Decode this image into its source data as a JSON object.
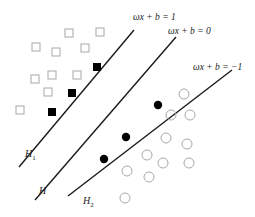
{
  "diagram": {
    "colors": {
      "line": "#1a1a1a",
      "hollow_marker": "#a8a8a8",
      "support_vector": "#000000",
      "text": "#222222"
    },
    "hyperplanes": [
      {
        "id": "H1",
        "label": "H",
        "subscript": "1",
        "equation": "ωx + b = 1",
        "x1": 19,
        "y1": 167,
        "x2": 134,
        "y2": 30,
        "label_pos": [
          25,
          157
        ],
        "eq_pos": [
          133,
          20
        ]
      },
      {
        "id": "H",
        "label": "H",
        "subscript": "",
        "equation": "ωx + b = 0",
        "x1": 35,
        "y1": 200,
        "x2": 176,
        "y2": 37,
        "label_pos": [
          39,
          194
        ],
        "eq_pos": [
          168,
          34
        ]
      },
      {
        "id": "H2",
        "label": "H",
        "subscript": "2",
        "equation": "ωx + b = −1",
        "x1": 68,
        "y1": 196,
        "x2": 232,
        "y2": 70,
        "label_pos": [
          83,
          204
        ],
        "eq_pos": [
          193,
          70
        ]
      }
    ],
    "class_positive": {
      "shape": "square",
      "hollow_points": [
        [
          69,
          33
        ],
        [
          100,
          32
        ],
        [
          36,
          47
        ],
        [
          56,
          52
        ],
        [
          85,
          48
        ],
        [
          52,
          75
        ],
        [
          77,
          75
        ],
        [
          35,
          79
        ],
        [
          48,
          92
        ],
        [
          20,
          110
        ]
      ],
      "support_vectors": [
        [
          97,
          67
        ],
        [
          72,
          93
        ],
        [
          52,
          112
        ]
      ]
    },
    "class_negative": {
      "shape": "circle",
      "hollow_points": [
        [
          184,
          94
        ],
        [
          171,
          115
        ],
        [
          190,
          115
        ],
        [
          166,
          138
        ],
        [
          187,
          144
        ],
        [
          147,
          155
        ],
        [
          163,
          163
        ],
        [
          189,
          163
        ],
        [
          127,
          171
        ],
        [
          149,
          177
        ],
        [
          125,
          198
        ]
      ],
      "support_vectors": [
        [
          158,
          105
        ],
        [
          126,
          137
        ],
        [
          104,
          159
        ]
      ]
    }
  }
}
